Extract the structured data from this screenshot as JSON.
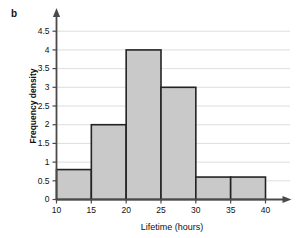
{
  "figure": {
    "panel_letter": "b",
    "background_color": "#ffffff"
  },
  "chart_data": {
    "type": "bar",
    "title": "",
    "subtitle": "",
    "xlabel": "Lifetime (hours)",
    "ylabel": "Frequency density",
    "categories": [
      "10–15",
      "15–20",
      "20–25",
      "25–30",
      "30–35",
      "35–40"
    ],
    "bin_edges": [
      10,
      15,
      20,
      25,
      30,
      35,
      40
    ],
    "values": [
      0.8,
      2.0,
      4.0,
      3.0,
      0.6,
      0.6
    ],
    "bin_width": 5,
    "xlim": [
      10,
      40
    ],
    "ylim": [
      0,
      4.8
    ],
    "xticks": [
      10,
      15,
      20,
      25,
      30,
      35,
      40
    ],
    "xtick_labels": [
      "10",
      "15",
      "20",
      "25",
      "30",
      "35",
      "40"
    ],
    "yticks": [
      0,
      0.5,
      1,
      1.5,
      2,
      2.5,
      3,
      3.5,
      4,
      4.5
    ],
    "ytick_labels": [
      "0",
      "0.5",
      "1",
      "1.5",
      "2",
      "2.5",
      "3",
      "3.5",
      "4",
      "4.5"
    ],
    "grid": true,
    "grid_axis": "y",
    "legend": null,
    "bar_fill_color": "#c9c9c9",
    "bar_edge_color": "#232323",
    "grid_color": "#d6d6d6",
    "axis_color": "#4a4a4a",
    "axis_arrows": true
  }
}
